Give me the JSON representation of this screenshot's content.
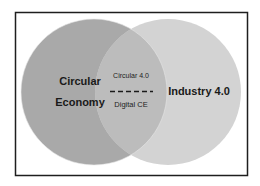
{
  "diagram": {
    "type": "venn",
    "frame": {
      "stroke": "#1e1e1e"
    },
    "sets": [
      {
        "id": "left",
        "label_lines": [
          "Circular",
          "Economy"
        ],
        "fill": "#a9a9a9"
      },
      {
        "id": "right",
        "label": "Industry 4.0",
        "fill": "#d3d3d3"
      }
    ],
    "intersection": {
      "fill": "#bcbcbc",
      "top_label": "Circular 4.0",
      "bottom_label": "Digital CE",
      "separator": "dashed-line"
    }
  }
}
